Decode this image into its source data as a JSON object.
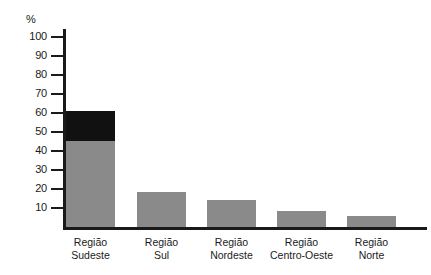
{
  "chart_data": {
    "type": "bar",
    "title": "",
    "subtitle": "",
    "xlabel": "",
    "ylabel": "%",
    "ylim": [
      0,
      100
    ],
    "grid": false,
    "legend": "none",
    "stacked": true,
    "y_unit_label": "%",
    "y_ticks": [
      100,
      90,
      80,
      70,
      60,
      50,
      40,
      30,
      20,
      10
    ],
    "categories": [
      "Região Sudeste",
      "Região Sul",
      "Região Nordeste",
      "Região Centro-Oeste",
      "Região Norte"
    ],
    "category_lines": [
      [
        "Região",
        "Sudeste"
      ],
      [
        "Região",
        "Sul"
      ],
      [
        "Região",
        "Nordeste"
      ],
      [
        "Região",
        "Centro-Oeste"
      ],
      [
        "Região",
        "Norte"
      ]
    ],
    "series": [
      {
        "name": "base",
        "color": "#8a8a8a",
        "values": [
          45,
          18.5,
          14,
          8.5,
          6
        ]
      },
      {
        "name": "highlight",
        "color": "#111111",
        "values": [
          16,
          0,
          0,
          0,
          0
        ]
      }
    ],
    "totals": [
      61,
      18.5,
      14,
      8.5,
      6
    ],
    "colors": {
      "bar_gray": "#8a8a8a",
      "bar_black": "#111111",
      "axis": "#1a1a1a",
      "background": "#ffffff"
    }
  },
  "axis": {
    "unit": "%",
    "ticks": [
      "100",
      "90",
      "80",
      "70",
      "60",
      "50",
      "40",
      "30",
      "20",
      "10"
    ]
  }
}
